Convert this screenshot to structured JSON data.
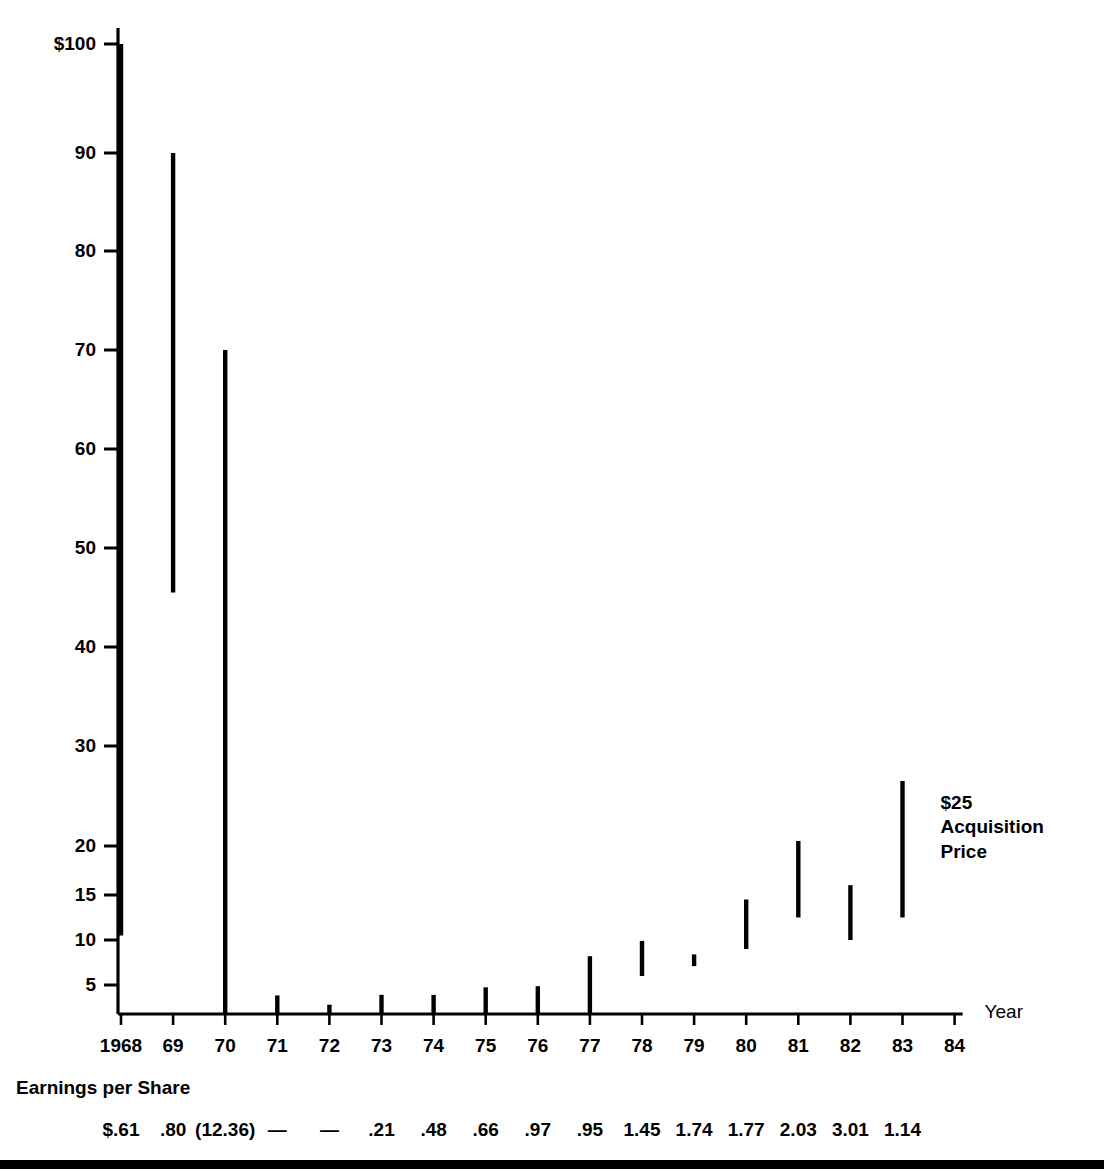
{
  "chart_data": {
    "type": "bar",
    "title": "",
    "subtitle": "",
    "xlabel": "Year",
    "ylabel": "",
    "grid": false,
    "legend": "none",
    "y_axis": {
      "ticks": [
        {
          "label": "$100",
          "value": 100
        },
        {
          "label": "90",
          "value": 90
        },
        {
          "label": "80",
          "value": 80
        },
        {
          "label": "70",
          "value": 70
        },
        {
          "label": "60",
          "value": 60
        },
        {
          "label": "50",
          "value": 50
        },
        {
          "label": "40",
          "value": 40
        },
        {
          "label": "30",
          "value": 30
        },
        {
          "label": "20",
          "value": 20
        },
        {
          "label": "15",
          "value": 15
        },
        {
          "label": "10",
          "value": 10
        },
        {
          "label": "5",
          "value": 5
        }
      ]
    },
    "categories": [
      "1968",
      "69",
      "70",
      "71",
      "72",
      "73",
      "74",
      "75",
      "76",
      "77",
      "78",
      "79",
      "80",
      "81",
      "82",
      "83",
      "84"
    ],
    "series": [
      {
        "name": "Price Range (High-Low)",
        "type": "high-low",
        "points": [
          {
            "x": "1968",
            "high": 100,
            "low": 10.5
          },
          {
            "x": "69",
            "high": 90,
            "low": 45.5
          },
          {
            "x": "70",
            "high": 70,
            "low": 0
          },
          {
            "x": "71",
            "high": 3.2,
            "low": 0
          },
          {
            "x": "72",
            "high": 1.6,
            "low": 0
          },
          {
            "x": "73",
            "high": 3.3,
            "low": 0
          },
          {
            "x": "74",
            "high": 3.3,
            "low": 0
          },
          {
            "x": "75",
            "high": 4.6,
            "low": 0
          },
          {
            "x": "76",
            "high": 4.8,
            "low": 0
          },
          {
            "x": "77",
            "high": 8.2,
            "low": 0
          },
          {
            "x": "78",
            "high": 9.9,
            "low": 6.0
          },
          {
            "x": "79",
            "high": 8.4,
            "low": 7.1
          },
          {
            "x": "80",
            "high": 14.5,
            "low": 9.0
          },
          {
            "x": "81",
            "high": 20.5,
            "low": 12.5
          },
          {
            "x": "82",
            "high": 16.0,
            "low": 10.0
          },
          {
            "x": "83",
            "high": 26.5,
            "low": 12.5
          },
          {
            "x": "84",
            "high": null,
            "low": null
          }
        ]
      }
    ],
    "earnings_per_share": {
      "caption": "Earnings per Share",
      "values": [
        {
          "x": "1968",
          "label": "$.61"
        },
        {
          "x": "69",
          "label": ".80"
        },
        {
          "x": "70",
          "label": "(12.36)"
        },
        {
          "x": "71",
          "label": "—"
        },
        {
          "x": "72",
          "label": "—"
        },
        {
          "x": "73",
          "label": ".21"
        },
        {
          "x": "74",
          "label": ".48"
        },
        {
          "x": "75",
          "label": ".66"
        },
        {
          "x": "76",
          "label": ".97"
        },
        {
          "x": "77",
          "label": ".95"
        },
        {
          "x": "78",
          "label": "1.45"
        },
        {
          "x": "79",
          "label": "1.74"
        },
        {
          "x": "80",
          "label": "1.77"
        },
        {
          "x": "81",
          "label": "2.03"
        },
        {
          "x": "82",
          "label": "3.01"
        },
        {
          "x": "83",
          "label": "1.14"
        }
      ]
    },
    "annotations": [
      {
        "name": "acquisition-price",
        "text": "$25\nAcquisition\nPrice",
        "x": "83"
      }
    ],
    "colors": {
      "ink": "#000000",
      "background": "#ffffff"
    }
  }
}
